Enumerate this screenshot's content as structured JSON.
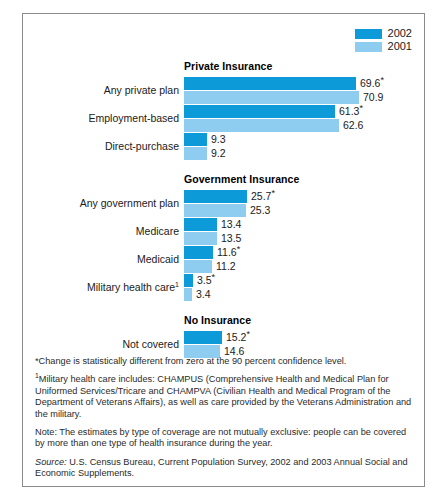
{
  "legend": {
    "items": [
      {
        "label": "2002",
        "color": "#0d9ad8"
      },
      {
        "label": "2001",
        "color": "#8ecdef"
      }
    ]
  },
  "colors": {
    "series_2002": "#0d9ad8",
    "series_2001": "#8ecdef",
    "frame": "#8b8b8b",
    "text": "#1a1a1a"
  },
  "chart_data": {
    "type": "bar",
    "orientation": "horizontal",
    "title": "",
    "xlabel": "",
    "ylabel": "",
    "xlim": [
      0,
      75
    ],
    "grid": false,
    "legend_position": "top-right",
    "series": [
      {
        "name": "2002",
        "color": "#0d9ad8"
      },
      {
        "name": "2001",
        "color": "#8ecdef"
      }
    ],
    "groups": [
      {
        "title": "Private Insurance",
        "rows": [
          {
            "category": "Any private plan",
            "footnote_marker": "",
            "values": [
              69.6,
              70.9
            ],
            "labels": [
              "69.6",
              "70.9"
            ],
            "significant": [
              true,
              false
            ]
          },
          {
            "category": "Employment-based",
            "footnote_marker": "",
            "values": [
              61.3,
              62.6
            ],
            "labels": [
              "61.3",
              "62.6"
            ],
            "significant": [
              true,
              false
            ]
          },
          {
            "category": "Direct-purchase",
            "footnote_marker": "",
            "values": [
              9.3,
              9.2
            ],
            "labels": [
              "9.3",
              "9.2"
            ],
            "significant": [
              false,
              false
            ]
          }
        ]
      },
      {
        "title": "Government Insurance",
        "rows": [
          {
            "category": "Any government plan",
            "footnote_marker": "",
            "values": [
              25.7,
              25.3
            ],
            "labels": [
              "25.7",
              "25.3"
            ],
            "significant": [
              true,
              false
            ]
          },
          {
            "category": "Medicare",
            "footnote_marker": "",
            "values": [
              13.4,
              13.5
            ],
            "labels": [
              "13.4",
              "13.5"
            ],
            "significant": [
              false,
              false
            ]
          },
          {
            "category": "Medicaid",
            "footnote_marker": "",
            "values": [
              11.6,
              11.2
            ],
            "labels": [
              "11.6",
              "11.2"
            ],
            "significant": [
              true,
              false
            ]
          },
          {
            "category": "Military health care",
            "footnote_marker": "1",
            "values": [
              3.5,
              3.4
            ],
            "labels": [
              "3.5",
              "3.4"
            ],
            "significant": [
              true,
              false
            ]
          }
        ]
      },
      {
        "title": "No Insurance",
        "rows": [
          {
            "category": "Not covered",
            "footnote_marker": "",
            "values": [
              15.2,
              14.6
            ],
            "labels": [
              "15.2",
              "14.6"
            ],
            "significant": [
              true,
              false
            ]
          }
        ]
      }
    ]
  },
  "notes": {
    "asterisk": "*Change is statistically different from zero at the 90 percent confidence level.",
    "footnote1_marker": "1",
    "footnote1": "Military health care includes: CHAMPUS  (Comprehensive Health and Medical Plan for Uniformed Services/Tricare and CHAMPVA (Civilian Health and Medical Program of the Department of Veterans Affairs), as well as care provided by the Veterans Administration and the military.",
    "note": "Note: The estimates by type of coverage are not mutually exclusive: people can be covered by more than one type of health insurance during the year.",
    "source_label": "Source:",
    "source_text": " U.S. Census Bureau, Current Population Survey, 2002 and 2003 Annual Social and Economic Supplements."
  }
}
